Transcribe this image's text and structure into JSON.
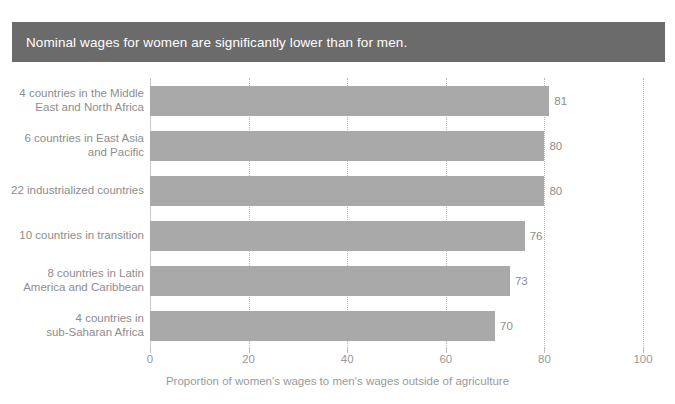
{
  "title": {
    "text": "Nominal wages for women are significantly lower than for men.",
    "background_color": "#6b6b6b",
    "text_color": "#ffffff"
  },
  "colors": {
    "bar": "#a9a9a9",
    "text": "#8d8d8d",
    "gridline": "#b9b9b9",
    "background": "#ffffff"
  },
  "chart_data": {
    "type": "bar",
    "orientation": "horizontal",
    "title": "Nominal wages for women are significantly lower than for men.",
    "xlabel": "Proportion of women's wages to men's wages outside of agriculture",
    "ylabel": "",
    "xlim": [
      0,
      100
    ],
    "xticks": [
      0,
      20,
      40,
      60,
      80,
      100
    ],
    "xticklabels": [
      "0",
      "20",
      "40",
      "60",
      "80",
      "100"
    ],
    "grid": "vertical-dotted",
    "legend": "none",
    "data_labels": true,
    "categories": [
      "4 countries in the Middle\nEast and North Africa",
      "6 countries in East Asia\nand Pacific",
      "22 industrialized countries",
      "10 countries in transition",
      "8 countries in Latin\nAmerica and Caribbean",
      "4 countries in\nsub-Saharan Africa"
    ],
    "values": [
      81,
      80,
      80,
      76,
      73,
      70
    ],
    "value_labels": [
      "81",
      "80",
      "80",
      "76",
      "73",
      "70"
    ]
  }
}
